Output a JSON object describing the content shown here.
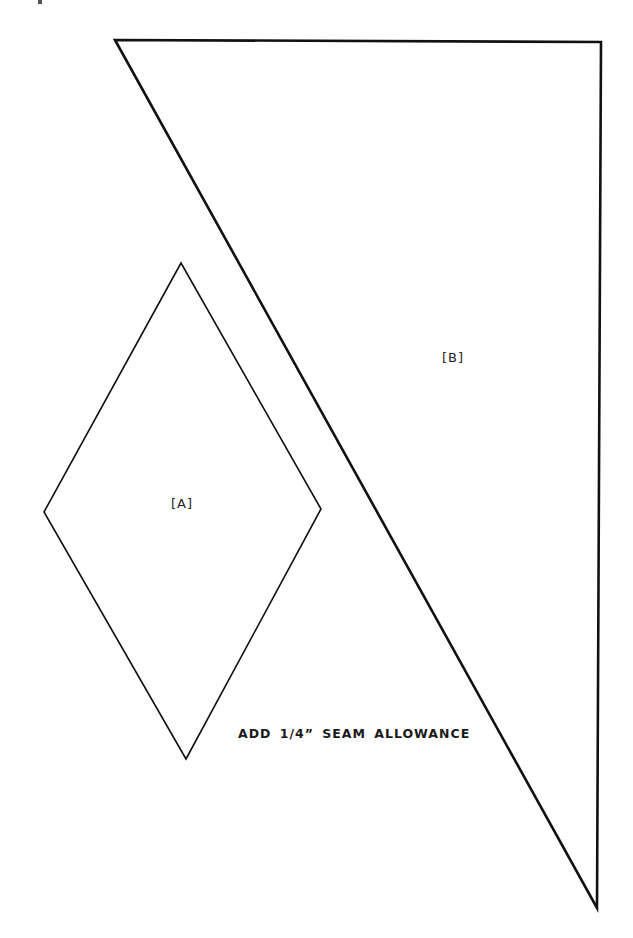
{
  "pattern": {
    "pieces": [
      {
        "id": "A",
        "label": "[A]",
        "shape": "diamond",
        "points": [
          [
            181,
            263
          ],
          [
            321,
            509
          ],
          [
            186,
            759
          ],
          [
            44,
            512
          ]
        ]
      },
      {
        "id": "B",
        "label": "[B]",
        "shape": "triangle",
        "points": [
          [
            115,
            40
          ],
          [
            601,
            42
          ],
          [
            597,
            908
          ]
        ]
      }
    ],
    "note": "ADD 1/4” SEAM ALLOWANCE"
  },
  "colors": {
    "background": "#ffffff",
    "stroke": "#111111",
    "text": "#222222"
  }
}
